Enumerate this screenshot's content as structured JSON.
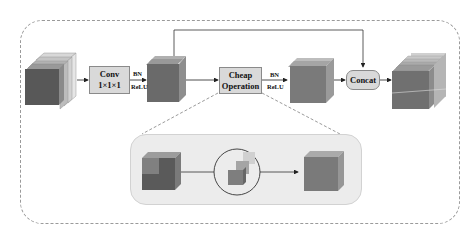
{
  "diagram": {
    "type": "ghost-module-architecture",
    "nodes": [
      {
        "id": "input",
        "kind": "feature-map-cube",
        "label": ""
      },
      {
        "id": "conv",
        "kind": "operation-box",
        "line1": "Conv",
        "line2": "1×1×1"
      },
      {
        "id": "intrinsic",
        "kind": "feature-map-cube",
        "label": ""
      },
      {
        "id": "cheap",
        "kind": "operation-box",
        "line1": "Cheap",
        "line2": "Operation"
      },
      {
        "id": "ghost",
        "kind": "feature-map-cube",
        "label": ""
      },
      {
        "id": "concat",
        "kind": "operation-box-rounded",
        "line1": "Concat"
      },
      {
        "id": "output",
        "kind": "feature-map-cube",
        "label": ""
      }
    ],
    "edge_labels": [
      {
        "after": "conv",
        "top": "BN",
        "bottom": "ReLU"
      },
      {
        "after": "cheap",
        "top": "BN",
        "bottom": "ReLU"
      }
    ],
    "edges": [
      [
        "input",
        "conv"
      ],
      [
        "conv",
        "intrinsic"
      ],
      [
        "intrinsic",
        "cheap"
      ],
      [
        "cheap",
        "ghost"
      ],
      [
        "ghost",
        "concat"
      ],
      [
        "intrinsic",
        "concat"
      ],
      [
        "concat",
        "output"
      ]
    ],
    "detail_inset": {
      "expands": "cheap",
      "items": [
        "split-cube-icon",
        "depthwise-cubes-circle-icon",
        "merged-cube-icon"
      ]
    },
    "colors": {
      "cube_front_dark": "#5e5e5e",
      "cube_front_mid": "#7b7b7b",
      "cube_top": "#a8a8a8",
      "cube_side": "#8c8c8c",
      "slice_light": "#c9c9c9",
      "box_fill": "#d9d9d9",
      "frame_dash": "#9a9a9a",
      "inset_fill": "#ececec"
    }
  }
}
